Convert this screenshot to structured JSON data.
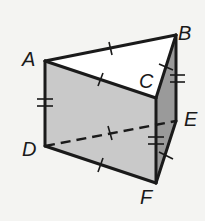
{
  "diagram": {
    "type": "triangular-prism",
    "vertices": {
      "A": {
        "label": "A",
        "x": 45,
        "y": 61
      },
      "B": {
        "label": "B",
        "x": 176,
        "y": 35
      },
      "C": {
        "label": "C",
        "x": 156,
        "y": 98
      },
      "D": {
        "label": "D",
        "x": 45,
        "y": 146
      },
      "E": {
        "label": "E",
        "x": 176,
        "y": 121
      },
      "F": {
        "label": "F",
        "x": 156,
        "y": 183
      }
    },
    "labels": {
      "A": "A",
      "B": "B",
      "C": "C",
      "D": "D",
      "E": "E",
      "F": "F"
    },
    "edges": [
      {
        "from": "A",
        "to": "B",
        "style": "solid",
        "ticks": 1
      },
      {
        "from": "A",
        "to": "C",
        "style": "solid",
        "ticks": 1
      },
      {
        "from": "B",
        "to": "C",
        "style": "solid",
        "ticks": 1
      },
      {
        "from": "A",
        "to": "D",
        "style": "solid",
        "ticks": 2
      },
      {
        "from": "B",
        "to": "E",
        "style": "solid",
        "ticks": 2
      },
      {
        "from": "C",
        "to": "F",
        "style": "solid",
        "ticks": 2
      },
      {
        "from": "D",
        "to": "E",
        "style": "dashed",
        "ticks": 1
      },
      {
        "from": "D",
        "to": "F",
        "style": "solid",
        "ticks": 1
      },
      {
        "from": "E",
        "to": "F",
        "style": "solid",
        "ticks": 1
      }
    ],
    "faces": [
      {
        "name": "front-face-ACFD",
        "color": "#c9c9c9"
      },
      {
        "name": "side-face-BCFE",
        "color": "#9a9a9a"
      },
      {
        "name": "top-face-ABC",
        "color": "#ffffff"
      }
    ]
  }
}
